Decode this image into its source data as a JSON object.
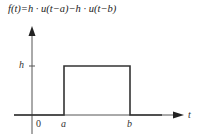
{
  "equation": "f(t)=h · u(t−a)−h · u(t−b)",
  "axes": {
    "x_label": "t",
    "origin_label": "0"
  },
  "pulse": {
    "height_label": "h",
    "start_label": "a",
    "end_label": "b"
  },
  "colors": {
    "line": "#333333",
    "axis": "#555555",
    "text": "#222222"
  }
}
